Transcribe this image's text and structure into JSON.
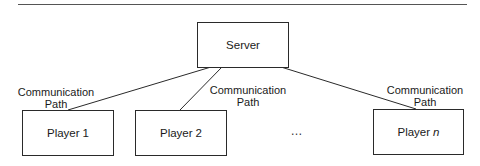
{
  "diagram": {
    "type": "client-server network",
    "server": {
      "label": "Server"
    },
    "players": [
      {
        "label": "Player",
        "suffix": "1",
        "suffix_italic": false
      },
      {
        "label": "Player",
        "suffix": "2",
        "suffix_italic": false
      },
      {
        "label": "Player",
        "suffix": "n",
        "suffix_italic": true
      }
    ],
    "ellipsis": "…",
    "links": [
      {
        "from": "Server",
        "to": "Player 1",
        "label_line1": "Communication",
        "label_line2": "Path"
      },
      {
        "from": "Server",
        "to": "Player 2",
        "label_line1": "Communication",
        "label_line2": "Path"
      },
      {
        "from": "Server",
        "to": "Player n",
        "label_line1": "Communication",
        "label_line2": "Path"
      }
    ],
    "colors": {
      "stroke": "#2a2a2a",
      "text": "#1a1a1a",
      "background": "#ffffff"
    }
  }
}
